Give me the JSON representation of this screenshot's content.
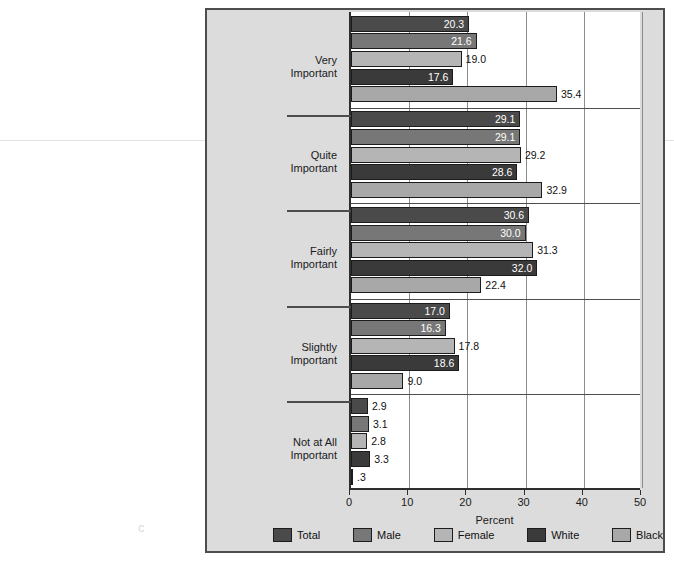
{
  "chart_data": {
    "type": "bar",
    "orientation": "horizontal",
    "title": "",
    "xlabel": "Percent",
    "ylabel": "",
    "xlim": [
      0,
      50
    ],
    "xticks": [
      "0",
      "10",
      "20",
      "30",
      "40",
      "50"
    ],
    "grid": true,
    "legend_position": "bottom",
    "categories": [
      "Very\nImportant",
      "Quite\nImportant",
      "Fairly\nImportant",
      "Slightly\nImportant",
      "Not at All\nImportant"
    ],
    "category_lines": [
      [
        "Very",
        "Important"
      ],
      [
        "Quite",
        "Important"
      ],
      [
        "Fairly",
        "Important"
      ],
      [
        "Slightly",
        "Important"
      ],
      [
        "Not at All",
        "Important"
      ]
    ],
    "series": [
      {
        "name": "Total",
        "color": "#4a4a4a",
        "values": [
          20.3,
          29.1,
          30.6,
          17.0,
          2.9
        ],
        "labels": [
          "20.3",
          "29.1",
          "30.6",
          "17.0",
          "2.9"
        ]
      },
      {
        "name": "Male",
        "color": "#777777",
        "values": [
          21.6,
          29.1,
          30.0,
          16.3,
          3.1
        ],
        "labels": [
          "21.6",
          "29.1",
          "30.0",
          "16.3",
          "3.1"
        ]
      },
      {
        "name": "Female",
        "color": "#b5b5b5",
        "values": [
          19.0,
          29.2,
          31.3,
          17.8,
          2.8
        ],
        "labels": [
          "19.0",
          "29.2",
          "31.3",
          "17.8",
          "2.8"
        ]
      },
      {
        "name": "White",
        "color": "#3a3a3a",
        "values": [
          17.6,
          28.6,
          32.0,
          18.6,
          3.3
        ],
        "labels": [
          "17.6",
          "28.6",
          "32.0",
          "18.6",
          "3.3"
        ]
      },
      {
        "name": "Black",
        "color": "#a8a8a8",
        "values": [
          35.4,
          32.9,
          22.4,
          9.0,
          0.3
        ],
        "labels": [
          "35.4",
          "32.9",
          "22.4",
          "9.0",
          ".3"
        ]
      }
    ]
  },
  "legend": {
    "items": [
      {
        "label": "Total",
        "color": "#4a4a4a"
      },
      {
        "label": "Male",
        "color": "#777777"
      },
      {
        "label": "Female",
        "color": "#b5b5b5"
      },
      {
        "label": "White",
        "color": "#3a3a3a"
      },
      {
        "label": "Black",
        "color": "#a8a8a8"
      }
    ]
  },
  "axis": {
    "x_title": "Percent"
  },
  "artifacts": {
    "smudge": "c"
  }
}
